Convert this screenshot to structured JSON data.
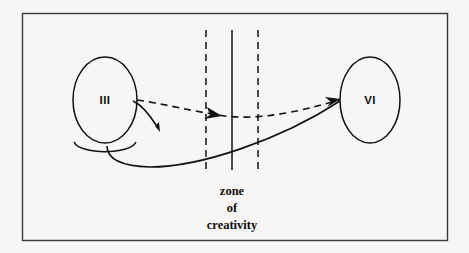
{
  "figure": {
    "background_color": "#f7f6f4",
    "ink_color": "#111111",
    "frame": {
      "name": "outer-border",
      "x": 22,
      "y": 13,
      "width": 425,
      "height": 227,
      "stroke_color": "#3a3a3a"
    }
  },
  "nodes": [
    {
      "id": "stage-three",
      "label": "III",
      "cx": 105,
      "cy": 100,
      "rx": 32,
      "ry": 43
    },
    {
      "id": "stage-six",
      "label": "VI",
      "cx": 370,
      "cy": 100,
      "rx": 30,
      "ry": 43
    }
  ],
  "zone": {
    "name": "zone-of-creativity",
    "label_lines": [
      "zone",
      "of",
      "creativity"
    ],
    "label_center_x": 232,
    "label_top_y": 190,
    "boundaries": [
      {
        "name": "zone-left-boundary",
        "x": 206,
        "style": "dashed",
        "y1": 30,
        "y2": 170
      },
      {
        "name": "zone-center-axis",
        "x": 232,
        "style": "solid",
        "y1": 30,
        "y2": 170
      },
      {
        "name": "zone-right-boundary",
        "x": 258,
        "style": "dashed",
        "y1": 30,
        "y2": 170
      }
    ]
  },
  "connections": [
    {
      "id": "dashed-path",
      "style": "dashed",
      "from": "stage-three",
      "to": "stage-six",
      "description": "dashed curve from III right edge dipping through the zone to VI",
      "midpoint_arrow_x": 215,
      "midpoint_arrow_y": 111
    },
    {
      "id": "solid-path",
      "style": "solid",
      "from": "stage-three",
      "to": "stage-six",
      "description": "solid curve leaving beneath III, dipping low, rising to VI"
    },
    {
      "id": "short-curved-arrow",
      "style": "solid",
      "from": "stage-three",
      "to": "free",
      "description": "short curved arrow below III pointing down-right"
    }
  ]
}
